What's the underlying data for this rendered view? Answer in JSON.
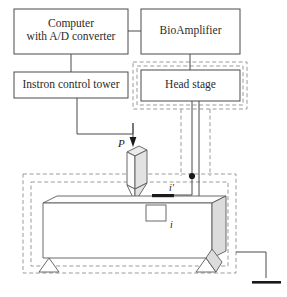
{
  "figure": {
    "type": "experimental-setup-schematic",
    "title": "",
    "background": "#ffffff",
    "line_color": "#4a4a4a",
    "shield_color": "#9a9a9a",
    "specimen_fill": "#fefefe",
    "specimen_shade": "#d8d8d8",
    "electrode_color": "#1a1a1a"
  },
  "boxes": {
    "computer": {
      "label_line1": "Computer",
      "label_line2": "with A/D converter"
    },
    "bioamplifier": {
      "label": "BioAmplifier"
    },
    "instron": {
      "label": "Instron control tower"
    },
    "headstage": {
      "label": "Head stage"
    }
  },
  "annotations": {
    "load": "P",
    "current_prime": "i′",
    "current": "i"
  },
  "icons": {
    "load_arrow": "load-arrow-icon",
    "ground": "ground-symbol-icon",
    "junction": "wire-junction-dot-icon",
    "indenter": "indenter-probe-icon",
    "specimen": "beam-specimen-icon",
    "support_left": "triangular-support-icon",
    "support_right": "triangular-support-icon",
    "shield_outer": "faraday-cage-outer-icon",
    "shield_inner": "faraday-cage-inner-icon"
  }
}
